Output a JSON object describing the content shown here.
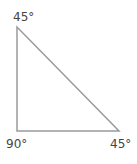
{
  "diagram": {
    "type": "right-triangle",
    "vertices": [
      {
        "id": "top",
        "angle_label": "45°"
      },
      {
        "id": "bottom-left",
        "angle_label": "90°"
      },
      {
        "id": "bottom-right",
        "angle_label": "45°"
      }
    ],
    "stroke_color": "#9a9a9a"
  }
}
